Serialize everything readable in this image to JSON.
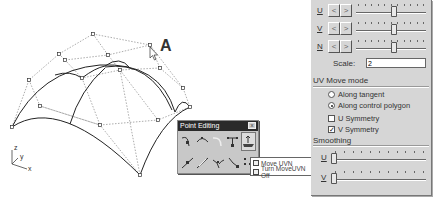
{
  "viewport": {
    "annotation_label": "A",
    "axes": {
      "z": "z",
      "y": "y",
      "x": "x"
    }
  },
  "point_editing_toolbar": {
    "title": "Point Editing",
    "close_label": "x",
    "row1_tools": [
      "insert-knot-icon",
      "insert-kink-icon",
      "edit-curve-icon",
      "handlebar-icon",
      "move-uvn-icon"
    ],
    "row2_tools": [
      "insert-point-icon",
      "remove-point-icon",
      "tweak-curve-icon",
      "adjust-end-icon",
      "toggle-points-icon"
    ],
    "active_tool_index": 4
  },
  "flyout": {
    "items": [
      {
        "label": "Move UVN",
        "icon": "move-uvn-icon"
      },
      {
        "label": "Turn MoveUVN Off",
        "icon": "move-uvn-off-icon"
      }
    ]
  },
  "panel": {
    "sliders": [
      {
        "label": "U",
        "left_button": "<",
        "right_button": ">",
        "thumb_pos": 0.5
      },
      {
        "label": "V",
        "left_button": "<",
        "right_button": ">",
        "thumb_pos": 0.5
      },
      {
        "label": "N",
        "left_button": "<",
        "right_button": ">",
        "thumb_pos": 0.5
      }
    ],
    "scale": {
      "label": "Scale:",
      "value": "2"
    },
    "uv_move_mode": {
      "title": "UV Move mode",
      "options": [
        {
          "label": "Along tangent",
          "selected": false
        },
        {
          "label": "Along control polygon",
          "selected": true
        }
      ],
      "checkboxes": [
        {
          "label": "U Symmetry",
          "checked": false
        },
        {
          "label": "V Symmetry",
          "checked": true
        }
      ]
    },
    "smoothing": {
      "title": "Smoothing",
      "sliders": [
        {
          "label": "U",
          "thumb_pos": 0.0
        },
        {
          "label": "V",
          "thumb_pos": 0.0
        }
      ]
    }
  }
}
